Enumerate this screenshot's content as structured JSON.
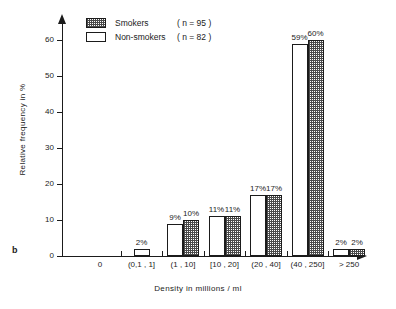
{
  "panel_label": "b",
  "legend": {
    "position": "top-left-inside",
    "entries": [
      {
        "label": "Smokers",
        "n_text": "( n = 95 )",
        "fill": "stippled"
      },
      {
        "label": "Non-smokers",
        "n_text": "( n = 82 )",
        "fill": "white"
      }
    ]
  },
  "axes": {
    "y_title": "Relative frequency in %",
    "x_title": "Density in millions / ml",
    "y_ticks": [
      "0",
      "10",
      "20",
      "30",
      "40",
      "50",
      "60"
    ],
    "x_origin_label": "0"
  },
  "colors": {
    "ink": "#1b1b1b",
    "background": "#ffffff",
    "hatch": "#4a4a4a"
  },
  "chart_data": {
    "type": "bar",
    "title": "",
    "subtitle": "",
    "xlabel": "Density in millions / ml",
    "ylabel": "Relative frequency in %",
    "ylim": [
      0,
      65
    ],
    "yticks": [
      0,
      10,
      20,
      30,
      40,
      50,
      60
    ],
    "grid": false,
    "legend_position": "top-left",
    "categories": [
      "(0,1 , 1]",
      "(1 , 10]",
      "[10 , 20]",
      "(20 , 40]",
      "(40 , 250]",
      "> 250"
    ],
    "series": [
      {
        "name": "Non-smokers",
        "n": 82,
        "values": [
          2,
          9,
          11,
          17,
          59,
          2
        ],
        "labels": [
          "2%",
          "9%",
          "11%",
          "17%",
          "59%",
          "2%"
        ]
      },
      {
        "name": "Smokers",
        "n": 95,
        "values": [
          null,
          10,
          11,
          17,
          60,
          2
        ],
        "labels": [
          "",
          "10%",
          "11%",
          "17%",
          "60%",
          "2%"
        ]
      }
    ],
    "annotations": [
      "b"
    ]
  }
}
